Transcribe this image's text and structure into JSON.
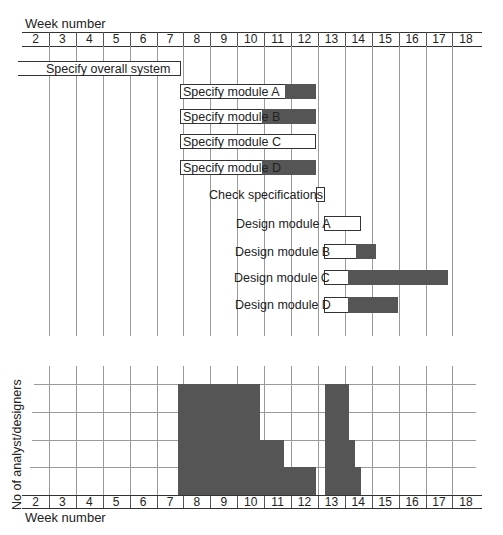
{
  "chart_data": [
    {
      "type": "gantt",
      "title": "Week number",
      "xlabel": "Week number",
      "weeks": [
        2,
        3,
        4,
        5,
        6,
        7,
        8,
        9,
        10,
        11,
        12,
        13,
        14,
        15,
        16,
        17,
        18
      ],
      "tasks": [
        {
          "name": "Specify overall system",
          "start": 1.85,
          "end": 7.9,
          "float_end": 7.9
        },
        {
          "name": "Specify module A",
          "start": 7.85,
          "end": 11.75,
          "float_end": 12.9
        },
        {
          "name": "Specify module B",
          "start": 7.85,
          "end": 10.9,
          "float_end": 12.9
        },
        {
          "name": "Specify module C",
          "start": 7.85,
          "end": 12.9,
          "float_end": 12.9
        },
        {
          "name": "Specify module D",
          "start": 7.85,
          "end": 10.9,
          "float_end": 12.9
        },
        {
          "name": "Check specifications",
          "start": 12.9,
          "end": 13.25,
          "float_end": 13.25
        },
        {
          "name": "Design module A",
          "start": 13.2,
          "end": 14.6,
          "float_end": 14.6
        },
        {
          "name": "Design module B",
          "start": 13.2,
          "end": 14.4,
          "float_end": 15.1
        },
        {
          "name": "Design module C",
          "start": 13.2,
          "end": 14.1,
          "float_end": 17.85
        },
        {
          "name": "Design module D",
          "start": 13.2,
          "end": 14.1,
          "float_end": 16.0
        }
      ],
      "legend": {
        "white": "activity duration",
        "dark": "float"
      }
    },
    {
      "type": "bar",
      "title": "Resource histogram",
      "xlabel": "Week number",
      "ylabel": "No of analyst/designers",
      "ylim": [
        0,
        4
      ],
      "segments": [
        {
          "start": 7.7,
          "end": 10.75,
          "value": 4
        },
        {
          "start": 10.75,
          "end": 11.6,
          "value": 2
        },
        {
          "start": 11.6,
          "end": 12.85,
          "value": 1
        },
        {
          "start": 13.2,
          "end": 14.1,
          "value": 4
        },
        {
          "start": 14.1,
          "end": 14.3,
          "value": 2
        },
        {
          "start": 14.3,
          "end": 14.55,
          "value": 1
        }
      ]
    }
  ],
  "labels": {
    "top_axis_title": "Week number",
    "bottom_axis_title": "Week number",
    "y_axis_title": "No of analyst/designers"
  },
  "weeks": [
    "2",
    "3",
    "4",
    "5",
    "6",
    "7",
    "8",
    "9",
    "10",
    "11",
    "12",
    "13",
    "14",
    "15",
    "16",
    "17",
    "18"
  ],
  "tasks": [
    "Specify overall system",
    "Specify module A",
    "Specify module B",
    "Specify module C",
    "Specify module D",
    "Check specifications",
    "Design module A",
    "Design module B",
    "Design module C",
    "Design module D"
  ]
}
